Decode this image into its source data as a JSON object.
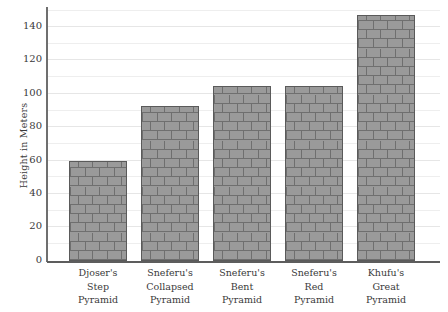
{
  "chart_data": {
    "type": "bar",
    "title": "",
    "subtitle": "",
    "xlabel": "",
    "ylabel": "Height in Meters",
    "categories": [
      "Djoser's Step Pyramid",
      "Sneferu's Collapsed Pyramid",
      "Sneferu's Bent Pyramid",
      "Sneferu's Red Pyramid",
      "Khufu's Great Pyramid"
    ],
    "category_lines": [
      [
        "Djoser's",
        "Step",
        "Pyramid"
      ],
      [
        "Sneferu's",
        "Collapsed",
        "Pyramid"
      ],
      [
        "Sneferu's",
        "Bent",
        "Pyramid"
      ],
      [
        "Sneferu's",
        "Red",
        "Pyramid"
      ],
      [
        "Khufu's",
        "Great",
        "Pyramid"
      ]
    ],
    "values": [
      60,
      93,
      105,
      105,
      147
    ],
    "ylim": [
      0,
      152
    ],
    "ytick_labels": [
      "0",
      "20",
      "40",
      "60",
      "80",
      "100",
      "120",
      "140"
    ],
    "ytick_values": [
      0,
      20,
      40,
      60,
      80,
      100,
      120,
      140
    ],
    "minor_gridline_values": [
      10,
      30,
      50,
      70,
      90,
      110,
      130,
      150
    ],
    "grid": true,
    "legend": false,
    "legend_position": "none",
    "bar_fill_color": "#9a9a9a",
    "bar_edge_color": "#5a5a5a",
    "bar_texture": "brick",
    "gridline_color": "#eeeeee",
    "axis_color": "#5d5d5d",
    "text_color": "#3a3a3a",
    "background_color": "#ffffff"
  }
}
